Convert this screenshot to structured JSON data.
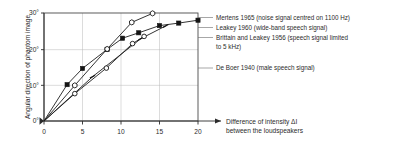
{
  "chart_data": {
    "type": "line",
    "title": "",
    "xlabel": "Difference of intensity ΔI between the loudspeakers",
    "xlabel_line1": "Difference of intensity ΔI",
    "xlabel_line2": "between the loudspeakers",
    "ylabel": "Angular direction of phantom image",
    "xlim": [
      0,
      20
    ],
    "ylim": [
      0,
      30
    ],
    "xticks": [
      0,
      5,
      10,
      15,
      20
    ],
    "xtick_labels": [
      "0",
      "5",
      "10",
      "15",
      "20"
    ],
    "yticks": [
      0,
      10,
      20,
      30
    ],
    "ytick_labels": [
      "0°",
      "10°",
      "20°",
      "30°"
    ],
    "grid": true,
    "legend_position": "right-outside",
    "series": [
      {
        "name": "Mertens 1965 (noise signal centred on 1100 Hz)",
        "label": "Mertens 1965 (noise signal centred on 1100 Hz)",
        "marker": "filled-square",
        "x": [
          0,
          3,
          5,
          8.2,
          10.2,
          12.3,
          15,
          17.5,
          20
        ],
        "y": [
          0,
          10.1,
          14.6,
          19.9,
          23.0,
          24.5,
          26.5,
          27.2,
          28.0
        ]
      },
      {
        "name": "Leakey 1960 (wide-band speech signal)",
        "label": "Leakey 1960 (wide-band speech signal)",
        "marker": "open-hexagon",
        "x": [
          0,
          4,
          8.2,
          11.4,
          14.1
        ],
        "y": [
          0,
          9.9,
          20.0,
          27.4,
          29.9
        ]
      },
      {
        "name": "Brittain and Leakey 1956 (speech signal limited to 5 kHz)",
        "label": "Brittain and Leakey 1956 (speech signal limited to 5 kHz)",
        "label_line1": "Brittain and Leakey 1956 (speech signal limited",
        "label_line2": "to 5 kHz)",
        "marker": "dash",
        "x": [
          0,
          6.3,
          12.6,
          15.8
        ],
        "y": [
          0,
          12.3,
          22.9,
          26.4
        ]
      },
      {
        "name": "De Boer 1940 (male speech signal)",
        "label": "De Boer 1940 (male speech signal)",
        "marker": "open-circle",
        "x": [
          0,
          4,
          8.1,
          11.5,
          13.0
        ],
        "y": [
          0,
          7.6,
          14.7,
          21.5,
          23.5
        ]
      }
    ]
  },
  "legend": {
    "items": [
      "Mertens 1965 (noise signal centred on 1100 Hz)",
      "Leakey 1960 (wide-band speech signal)",
      "Brittain and Leakey 1956 (speech signal limited",
      "to 5 kHz)",
      "De Boer 1940 (male speech signal)"
    ]
  }
}
